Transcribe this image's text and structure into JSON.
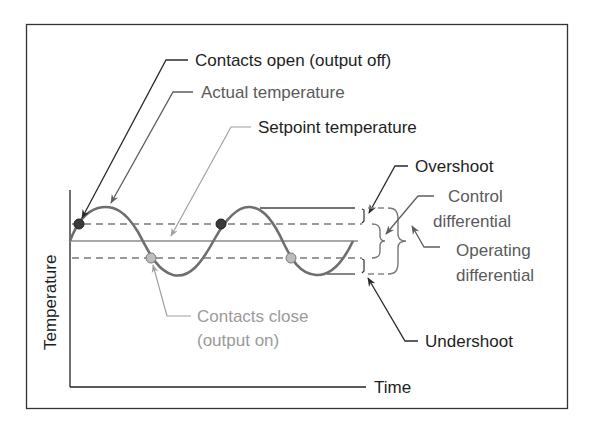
{
  "diagram": {
    "axes": {
      "y_label": "Temperature",
      "x_label": "Time"
    },
    "labels": {
      "contacts_open": "Contacts open (output off)",
      "actual_temperature": "Actual temperature",
      "setpoint_temperature": "Setpoint temperature",
      "overshoot": "Overshoot",
      "control_differential_line1": "Control",
      "control_differential_line2": "differential",
      "operating_differential_line1": "Operating",
      "operating_differential_line2": "differential",
      "undershoot": "Undershoot",
      "contacts_close_line1": "Contacts close",
      "contacts_close_line2": "(output on)"
    },
    "levels": {
      "overshoot_y": 208,
      "upper_switch_y": 224,
      "setpoint_y": 241,
      "lower_switch_y": 258,
      "undershoot_y": 274
    },
    "markers": {
      "contacts_open_points": 2,
      "contacts_close_points": 2
    },
    "colors": {
      "dark": "#1e1e1e",
      "wave": "#6e6e6e",
      "setpoint": "#a8a8a8",
      "dashed": "#7a7a7a",
      "light_text": "#9a9a9a",
      "open_marker": "#3a3a3a",
      "close_marker": "#bdbdbd"
    }
  }
}
